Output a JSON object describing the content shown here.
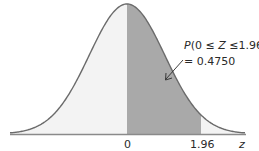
{
  "chart_data": {
    "type": "area",
    "title": "",
    "xlabel": "z",
    "ylabel": "",
    "x_ticks": [
      "0",
      "1.96"
    ],
    "shaded_region": {
      "from": 0,
      "to": 1.96
    },
    "annotation": {
      "line1": "P(0 ≤ Z ≤1.96)",
      "line2": "= 0.4750",
      "probability": 0.475
    },
    "grid": false,
    "legend": null
  },
  "colors": {
    "curve": "#6b6b6b",
    "shade": "#a9a9a9",
    "unshaded": "#f3f3f3",
    "axis": "#8a8a8a",
    "text": "#2a2a2a"
  },
  "labels": {
    "tick_zero": "0",
    "tick_196": "1.96",
    "axis_z": "z",
    "ann_p": "P",
    "ann_rest": "(0 ≤ ",
    "ann_Z": "Z",
    "ann_end": " ≤1.96)",
    "ann_value": "= 0.4750"
  }
}
